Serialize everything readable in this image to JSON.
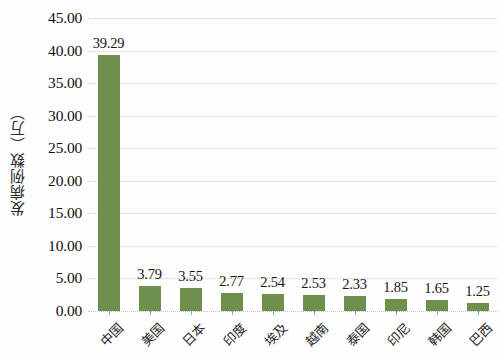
{
  "chart_data": {
    "type": "bar",
    "title": "",
    "subtitle": "",
    "xlabel": "",
    "ylabel": "发病例数（万）",
    "ylim": [
      0,
      45
    ],
    "ytick_step": 5,
    "ytick_labels": [
      "45.00",
      "40.00",
      "35.00",
      "30.00",
      "25.00",
      "20.00",
      "15.00",
      "10.00",
      "5.00",
      "0.00"
    ],
    "ytick_values": [
      45,
      40,
      35,
      30,
      25,
      20,
      15,
      10,
      5,
      0
    ],
    "grid": true,
    "legend": "none",
    "categories": [
      "中国",
      "美国",
      "日本",
      "印度",
      "埃及",
      "越南",
      "泰国",
      "印尼",
      "韩国",
      "巴西"
    ],
    "values": [
      39.29,
      3.79,
      3.55,
      2.77,
      2.54,
      2.53,
      2.33,
      1.85,
      1.65,
      1.25
    ],
    "value_labels": [
      "39.29",
      "3.79",
      "3.55",
      "2.77",
      "2.54",
      "2.53",
      "2.33",
      "1.85",
      "1.65",
      "1.25"
    ],
    "bar_color": "#6f8f4c",
    "gridline_color": "#cfcfcf",
    "background_color": "#fefefe",
    "text_color": "#151515"
  }
}
